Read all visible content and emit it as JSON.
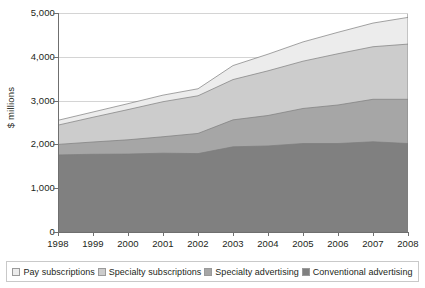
{
  "chart_data": {
    "type": "area",
    "stacked": true,
    "title": "",
    "subtitle": "",
    "xlabel": "",
    "ylabel": "$ millions",
    "categories": [
      "1998",
      "1999",
      "2000",
      "2001",
      "2002",
      "2003",
      "2004",
      "2005",
      "2006",
      "2007",
      "2008"
    ],
    "x": [
      1998,
      1999,
      2000,
      2001,
      2002,
      2003,
      2004,
      2005,
      2006,
      2007,
      2008
    ],
    "xlim": [
      1998,
      2008
    ],
    "ylim": [
      0,
      5000
    ],
    "yticks": [
      0,
      1000,
      2000,
      3000,
      4000,
      5000
    ],
    "ytick_labels": [
      "0",
      "1,000",
      "2,000",
      "3,000",
      "4,000",
      "5,000"
    ],
    "xtick_labels": [
      "1998",
      "1999",
      "2000",
      "2001",
      "2002",
      "2003",
      "2004",
      "2005",
      "2006",
      "2007",
      "2008"
    ],
    "grid": true,
    "grid_axis": "y",
    "legend_position": "bottom",
    "series": [
      {
        "name": "Conventional advertising",
        "color": "#808080",
        "stack_order": 1,
        "values": [
          1760,
          1775,
          1780,
          1800,
          1790,
          1945,
          1965,
          2020,
          2020,
          2060,
          2020
        ],
        "cumulative": [
          1760,
          1775,
          1780,
          1800,
          1790,
          1945,
          1965,
          2020,
          2020,
          2060,
          2020
        ]
      },
      {
        "name": "Specialty advertising",
        "color": "#a6a6a6",
        "stack_order": 2,
        "values": [
          240,
          280,
          325,
          375,
          460,
          615,
          695,
          800,
          880,
          970,
          1010
        ],
        "cumulative": [
          2000,
          2055,
          2105,
          2175,
          2250,
          2560,
          2660,
          2820,
          2900,
          3030,
          3030
        ]
      },
      {
        "name": "Specialty subscriptions",
        "color": "#cccccc",
        "stack_order": 3,
        "values": [
          440,
          565,
          690,
          800,
          860,
          920,
          1020,
          1080,
          1170,
          1200,
          1260
        ],
        "cumulative": [
          2440,
          2620,
          2795,
          2975,
          3110,
          3480,
          3680,
          3900,
          4070,
          4230,
          4290
        ]
      },
      {
        "name": "Pay subscriptions",
        "color": "#ececec",
        "stack_order": 4,
        "values": [
          110,
          120,
          135,
          150,
          160,
          320,
          380,
          440,
          490,
          540,
          610
        ],
        "cumulative": [
          2550,
          2740,
          2930,
          3125,
          3270,
          3800,
          4060,
          4340,
          4560,
          4770,
          4900
        ]
      }
    ],
    "totals": [
      2550,
      2740,
      2930,
      3125,
      3270,
      3800,
      4060,
      4340,
      4560,
      4770,
      4900
    ]
  },
  "axes": {
    "y_title": "$ millions"
  },
  "legend": {
    "items": [
      {
        "label": "Pay subscriptions",
        "color": "#ececec"
      },
      {
        "label": "Specialty subscriptions",
        "color": "#cccccc"
      },
      {
        "label": "Specialty advertising",
        "color": "#a6a6a6"
      },
      {
        "label": "Conventional advertising",
        "color": "#808080"
      }
    ]
  }
}
